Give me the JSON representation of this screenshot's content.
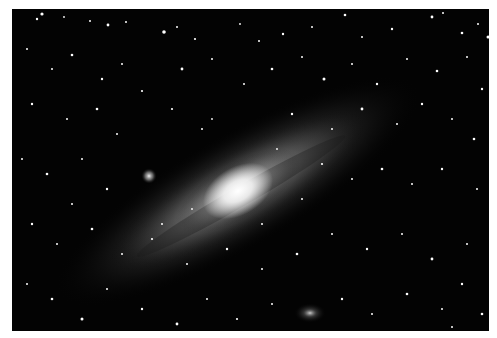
{
  "image": {
    "subject": "Andromeda Galaxy (M31) astrophotograph",
    "background_color": "#030303",
    "frame_color": "#ffffff",
    "galaxy": {
      "cx": 226,
      "cy": 182,
      "core_color": "#ffffff",
      "halo_color": "#9a9a9a",
      "tilt_deg": -30
    },
    "companions": [
      {
        "name": "M32",
        "cx": 137,
        "cy": 167,
        "r": 5
      },
      {
        "name": "M110",
        "cx": 298,
        "cy": 304,
        "r": 12
      }
    ]
  }
}
